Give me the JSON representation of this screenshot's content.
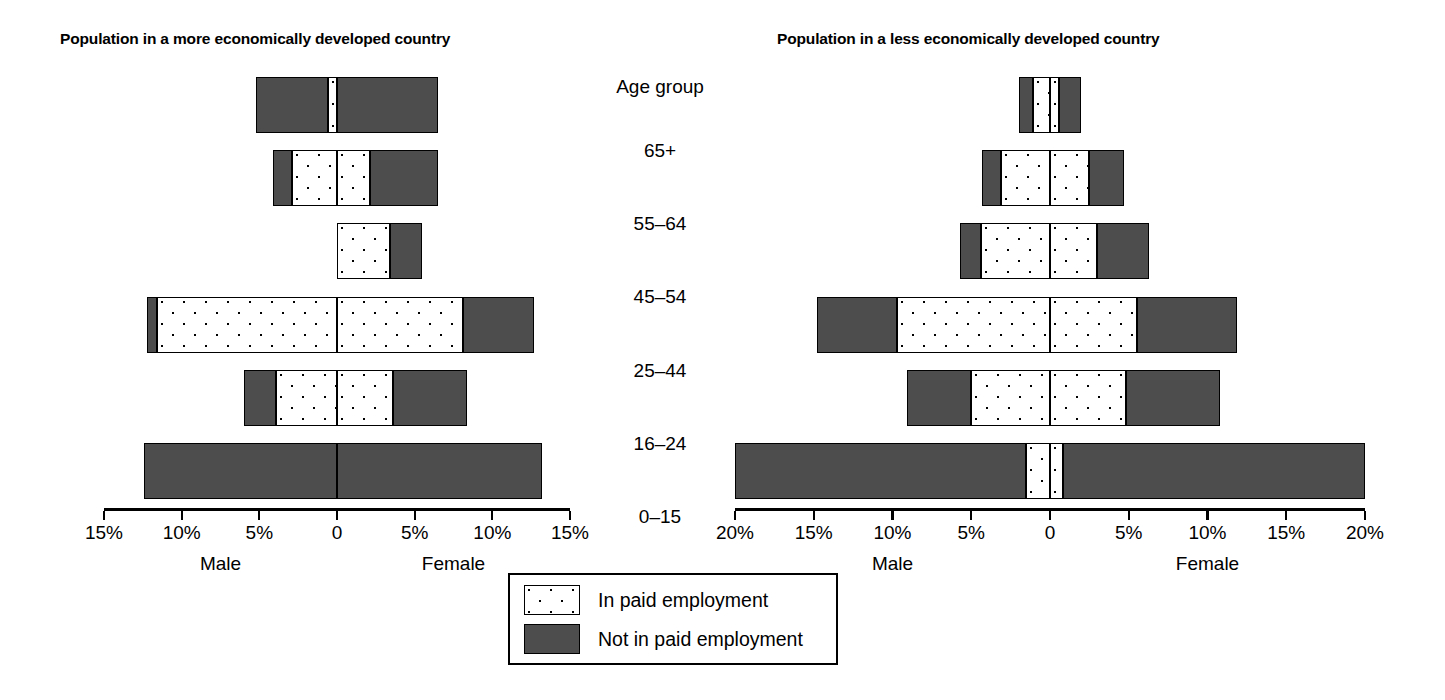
{
  "charts": [
    {
      "id": "more-developed",
      "title": "Population in a more economically developed country",
      "male_label": "Male",
      "female_label": "Female",
      "axis_max": 15,
      "tick_labels": [
        "15%",
        "10%",
        "5%",
        "0",
        "5%",
        "10%",
        "15%"
      ]
    },
    {
      "id": "less-developed",
      "title": "Population in a less economically developed country",
      "male_label": "Male",
      "female_label": "Female",
      "axis_max": 20,
      "tick_labels": [
        "20%",
        "15%",
        "10%",
        "5%",
        "0",
        "5%",
        "10%",
        "15%",
        "20%"
      ]
    }
  ],
  "age_column": {
    "header": "Age group",
    "labels": [
      "65+",
      "55–64",
      "45–54",
      "25–44",
      "16–24",
      "0–15"
    ]
  },
  "legend": {
    "items": [
      {
        "key": "paid",
        "pattern": "dots",
        "label": "In paid employment"
      },
      {
        "key": "notpaid",
        "pattern": "dark",
        "label": "Not in paid employment"
      }
    ]
  },
  "colors": {
    "not_in_paid_employment": "#4d4d4d",
    "in_paid_employment": "#ffffff",
    "outline": "#000000",
    "background": "#ffffff"
  },
  "chart_data": [
    {
      "type": "bar",
      "subtype": "population-pyramid",
      "title": "Population in a more economically developed country",
      "xlabel": "",
      "ylabel": "Age group",
      "xlim": [
        -15,
        15
      ],
      "xtick_values": [
        -15,
        -10,
        -5,
        0,
        5,
        10,
        15
      ],
      "xtick_labels": [
        "15%",
        "10%",
        "5%",
        "0",
        "5%",
        "10%",
        "15%"
      ],
      "grid": false,
      "legend_position": "bottom-center",
      "categories": [
        "65+",
        "55–64",
        "45–54",
        "25–44",
        "16–24",
        "0–15"
      ],
      "series": [
        {
          "name": "Male - In paid employment",
          "side": "male",
          "pattern": "dots",
          "values": [
            0.6,
            2.9,
            0.0,
            11.6,
            3.9,
            0.0
          ]
        },
        {
          "name": "Male - Not in paid employment",
          "side": "male",
          "pattern": "dark",
          "values": [
            4.6,
            1.2,
            0.0,
            0.6,
            2.1,
            12.4
          ]
        },
        {
          "name": "Female - In paid employment",
          "side": "female",
          "pattern": "dots",
          "values": [
            0.0,
            2.1,
            3.4,
            8.1,
            3.6,
            0.0
          ]
        },
        {
          "name": "Female - Not in paid employment",
          "side": "female",
          "pattern": "dark",
          "values": [
            6.5,
            4.4,
            2.1,
            4.6,
            4.8,
            13.2
          ]
        }
      ]
    },
    {
      "type": "bar",
      "subtype": "population-pyramid",
      "title": "Population in a less economically developed country",
      "xlabel": "",
      "ylabel": "Age group",
      "xlim": [
        -20,
        20
      ],
      "xtick_values": [
        -20,
        -15,
        -10,
        -5,
        0,
        5,
        10,
        15,
        20
      ],
      "xtick_labels": [
        "20%",
        "15%",
        "10%",
        "5%",
        "0",
        "5%",
        "10%",
        "15%",
        "20%"
      ],
      "grid": false,
      "legend_position": "bottom-center",
      "categories": [
        "65+",
        "55–64",
        "45–54",
        "25–44",
        "16–24",
        "0–15"
      ],
      "series": [
        {
          "name": "Male - In paid employment",
          "side": "male",
          "pattern": "dots",
          "values": [
            1.1,
            3.1,
            4.4,
            9.7,
            5.0,
            1.5
          ]
        },
        {
          "name": "Male - Not in paid employment",
          "side": "male",
          "pattern": "dark",
          "values": [
            0.9,
            1.2,
            1.3,
            5.1,
            4.1,
            18.5
          ]
        },
        {
          "name": "Female - In paid employment",
          "side": "female",
          "pattern": "dots",
          "values": [
            0.6,
            2.5,
            3.0,
            5.5,
            4.8,
            0.8
          ]
        },
        {
          "name": "Female - Not in paid employment",
          "side": "female",
          "pattern": "dark",
          "values": [
            1.4,
            2.2,
            3.3,
            6.4,
            6.0,
            19.2
          ]
        }
      ]
    }
  ]
}
